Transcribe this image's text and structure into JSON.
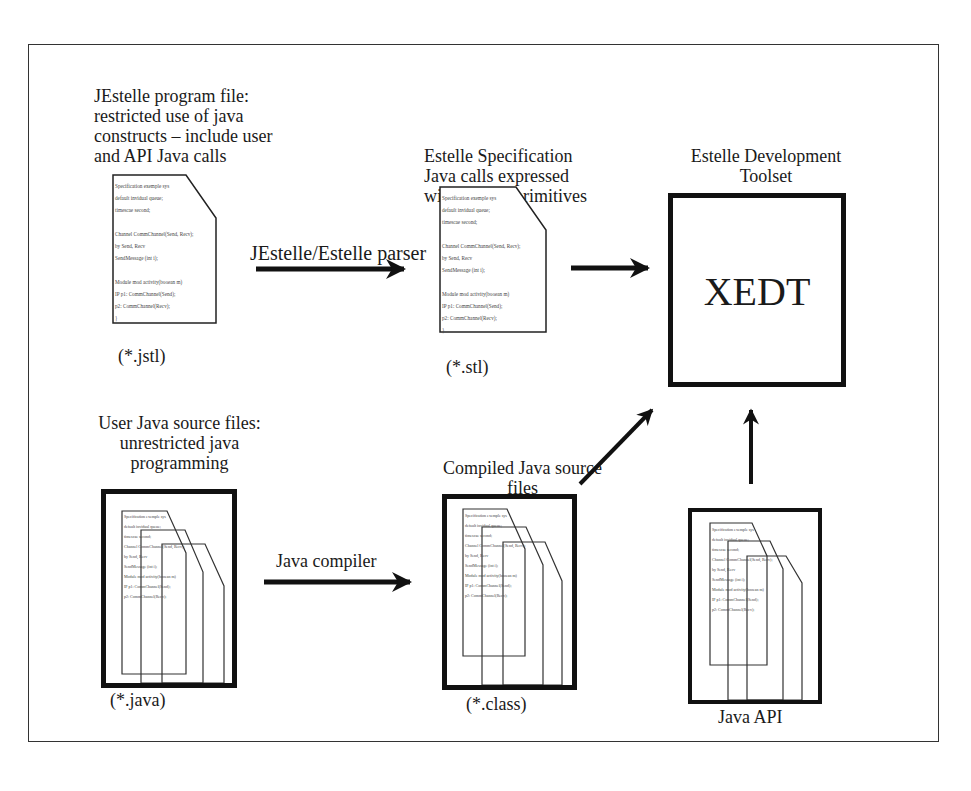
{
  "diagram": {
    "jestelle_file": {
      "title_lines": [
        "JEstelle program file:",
        "restricted use of java",
        "constructs – include user",
        "and API Java calls"
      ],
      "extension": "(*.jstl)"
    },
    "estelle_spec": {
      "title_lines": [
        "Estelle Specification",
        "Java calls expressed",
        "with Estelle primitives"
      ],
      "extension": "(*.stl)"
    },
    "dev_toolset": {
      "title_lines": [
        "Estelle Development",
        "Toolset"
      ],
      "box_label": "XEDT"
    },
    "user_java": {
      "title_lines": [
        "User Java source files:",
        "unrestricted java",
        "programming"
      ],
      "extension": "(*.java)"
    },
    "compiled_java": {
      "title_lines": [
        "Compiled Java source",
        "files"
      ],
      "extension": "(*.class)"
    },
    "java_api": {
      "caption": "Java API"
    },
    "arrows": {
      "parser_label": "JEstelle/Estelle parser",
      "compiler_label": "Java compiler"
    },
    "code_snippet_lines": [
      "Specification exemple sys",
      "default invidual queue;",
      "timescae second;",
      "",
      "Channel CommChannel(Send, Recv);",
      "by Send, Recv",
      "   SendMessage (int i);",
      "",
      "Module mod activity(booean m)",
      "IP p1: CommChannel(Send);",
      "   p2: CommChannel(Recv);",
      "}"
    ]
  }
}
